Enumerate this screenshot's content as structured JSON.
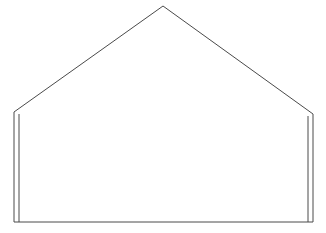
{
  "diagram": {
    "type": "gable-outline",
    "canvas": {
      "width": 326,
      "height": 233,
      "background": "#ffffff"
    },
    "stroke": {
      "color": "#4a4a4a",
      "width": 1
    },
    "shape": {
      "peak": [
        163,
        6
      ],
      "left_eave": [
        14,
        112
      ],
      "right_eave": [
        313,
        114
      ],
      "bottom_left": [
        14,
        222
      ],
      "bottom_right": [
        313,
        222
      ],
      "inner_wall_left": {
        "x": 19,
        "y_top": 114,
        "y_bottom": 222
      },
      "inner_wall_right": {
        "x": 308,
        "y_top": 116,
        "y_bottom": 222
      }
    }
  }
}
